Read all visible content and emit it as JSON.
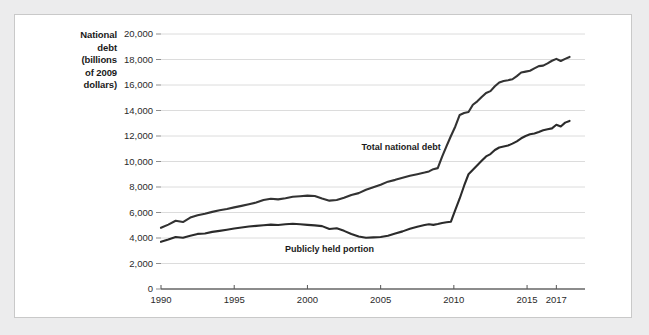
{
  "chart_data": {
    "type": "line",
    "title": "",
    "xlabel": "",
    "ylabel": "National debt (billions of 2009 dollars)",
    "ylabel_lines": [
      "National",
      "debt",
      "(billions",
      "of 2009",
      "dollars)"
    ],
    "xlim": [
      1990,
      2018
    ],
    "ylim": [
      0,
      20000
    ],
    "grid": "horizontal",
    "legend_position": "inline-annotations",
    "x_ticks": [
      1990,
      1995,
      2000,
      2005,
      2010,
      2015,
      2017
    ],
    "x_tick_labels": [
      "1990",
      "1995",
      "2000",
      "2005",
      "2010",
      "2015",
      "2017"
    ],
    "y_ticks": [
      0,
      2000,
      4000,
      6000,
      8000,
      10000,
      12000,
      14000,
      16000,
      18000,
      20000
    ],
    "y_tick_labels": [
      "0",
      "2,000",
      "4,000",
      "6,000",
      "8,000",
      "10,000",
      "12,000",
      "14,000",
      "16,000",
      "18,000",
      "20,000"
    ],
    "x": [
      1990.0,
      1990.5,
      1991.0,
      1991.5,
      1992.0,
      1992.5,
      1993.0,
      1993.5,
      1994.0,
      1994.5,
      1995.0,
      1995.5,
      1996.0,
      1996.5,
      1997.0,
      1997.5,
      1998.0,
      1998.5,
      1999.0,
      1999.5,
      2000.0,
      2000.5,
      2001.0,
      2001.5,
      2002.0,
      2002.5,
      2003.0,
      2003.5,
      2004.0,
      2004.5,
      2005.0,
      2005.5,
      2006.0,
      2006.5,
      2007.0,
      2007.5,
      2008.0,
      2008.3,
      2008.6,
      2008.9,
      2009.2,
      2009.5,
      2009.8,
      2010.1,
      2010.4,
      2010.7,
      2011.0,
      2011.3,
      2011.6,
      2011.9,
      2012.2,
      2012.5,
      2012.8,
      2013.1,
      2013.4,
      2013.7,
      2014.0,
      2014.3,
      2014.6,
      2014.9,
      2015.2,
      2015.5,
      2015.8,
      2016.1,
      2016.4,
      2016.7,
      2017.0,
      2017.3,
      2017.6,
      2017.9
    ],
    "series": [
      {
        "name": "Total national debt",
        "color": "#333333",
        "annotation_x": 2006.4,
        "annotation_y": 11150,
        "values": [
          4800,
          5050,
          5350,
          5250,
          5600,
          5780,
          5900,
          6050,
          6180,
          6280,
          6400,
          6520,
          6650,
          6780,
          6980,
          7080,
          7030,
          7120,
          7230,
          7280,
          7320,
          7300,
          7100,
          6930,
          6980,
          7150,
          7380,
          7520,
          7780,
          7980,
          8180,
          8420,
          8560,
          8720,
          8880,
          9000,
          9130,
          9220,
          9400,
          9480,
          10380,
          11200,
          12000,
          12750,
          13650,
          13800,
          13880,
          14450,
          14720,
          15050,
          15380,
          15520,
          15900,
          16200,
          16320,
          16380,
          16450,
          16700,
          16980,
          17050,
          17120,
          17300,
          17480,
          17520,
          17700,
          17900,
          18050,
          17880,
          18050,
          18200
        ]
      },
      {
        "name": "Publicly held portion",
        "color": "#2b2b2b",
        "annotation_x": 2001.5,
        "annotation_y": 3150,
        "values": [
          3700,
          3880,
          4080,
          4020,
          4180,
          4320,
          4350,
          4480,
          4560,
          4650,
          4750,
          4820,
          4900,
          4950,
          5000,
          5050,
          5020,
          5080,
          5120,
          5080,
          5030,
          4990,
          4930,
          4700,
          4760,
          4560,
          4320,
          4120,
          4020,
          4050,
          4080,
          4180,
          4350,
          4520,
          4720,
          4880,
          5020,
          5080,
          5030,
          5100,
          5180,
          5230,
          5280,
          6200,
          7100,
          8100,
          9000,
          9350,
          9700,
          10050,
          10400,
          10580,
          10900,
          11100,
          11180,
          11250,
          11400,
          11580,
          11820,
          12000,
          12130,
          12200,
          12320,
          12450,
          12530,
          12600,
          12880,
          12750,
          13050,
          13180
        ]
      }
    ]
  }
}
